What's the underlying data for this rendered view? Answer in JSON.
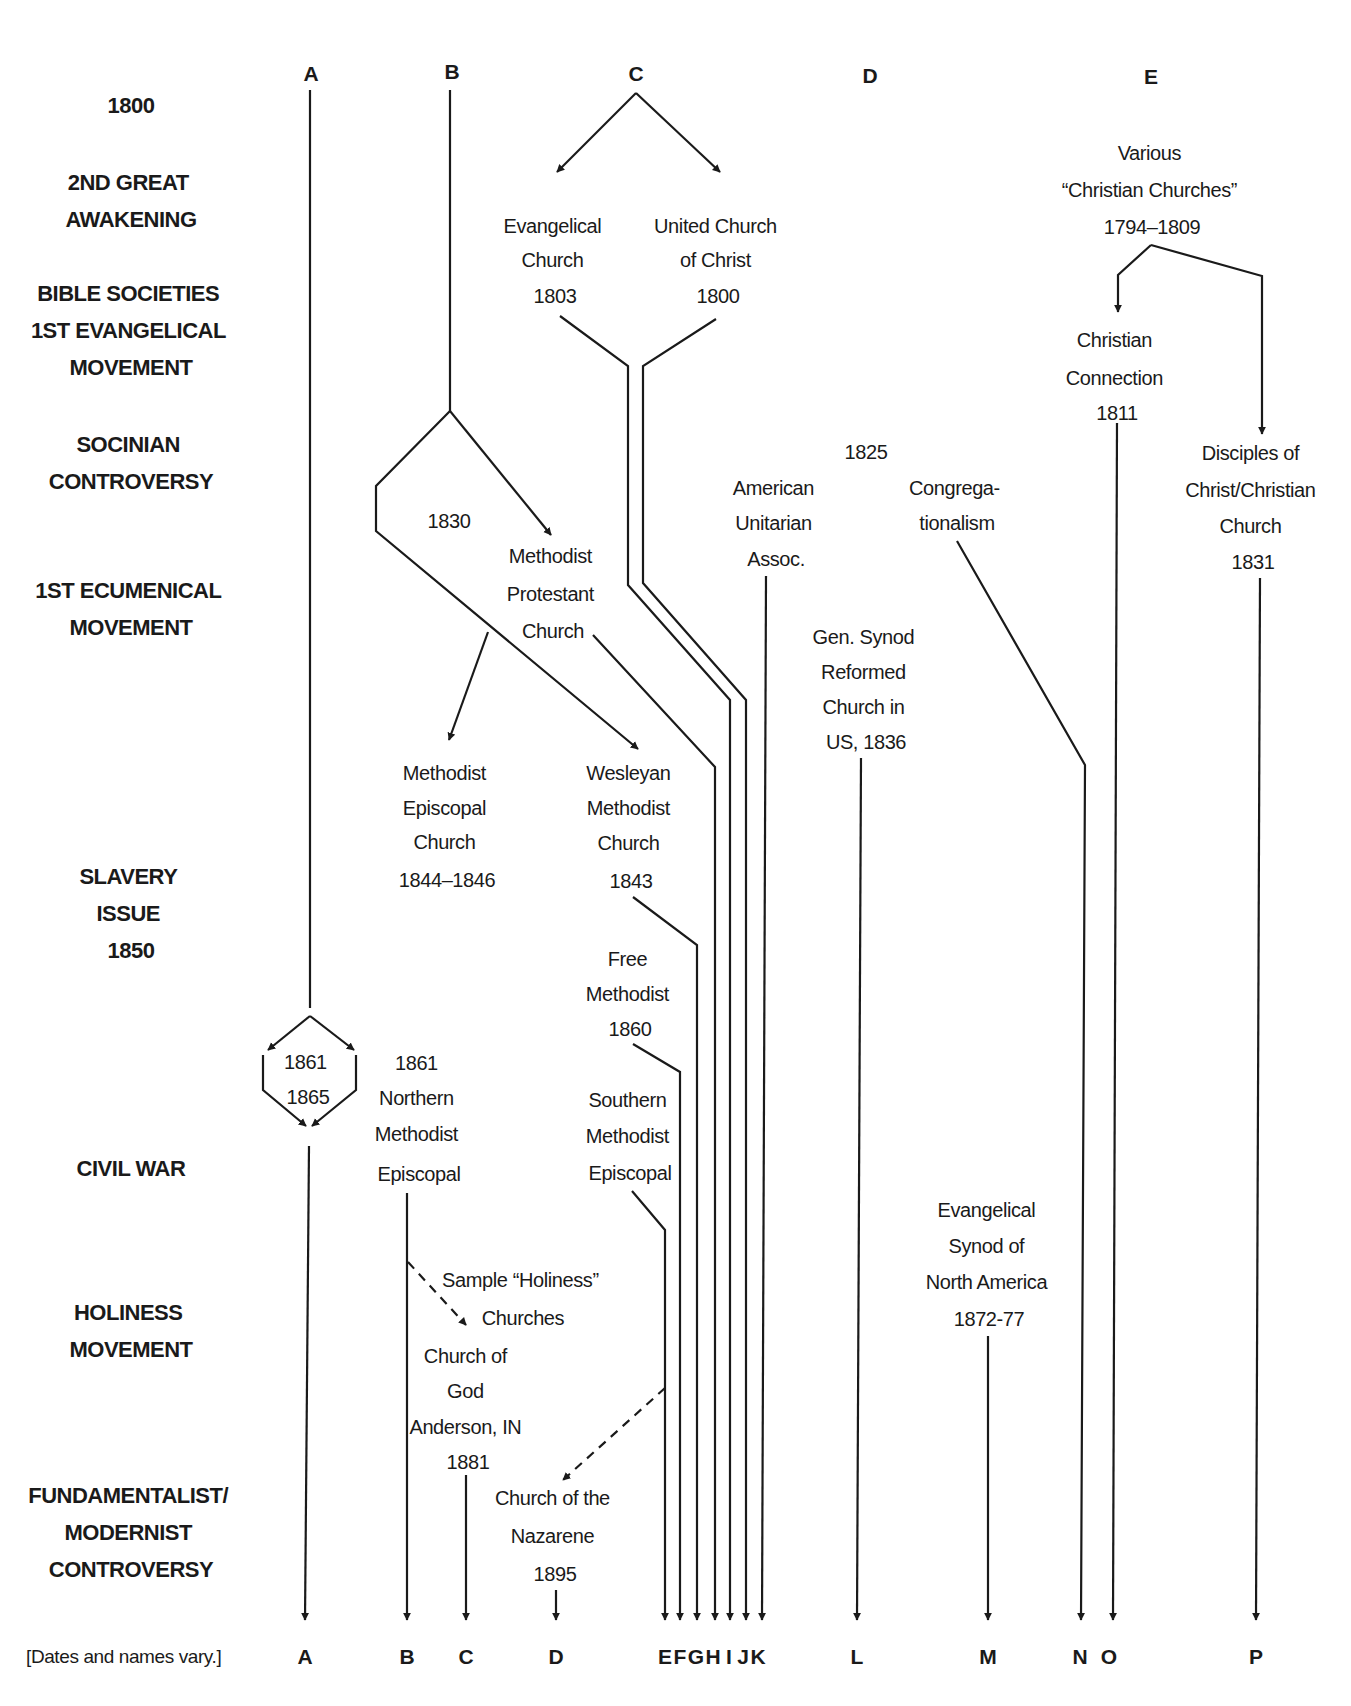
{
  "top_columns": [
    {
      "id": "A",
      "x": 288
    },
    {
      "id": "B",
      "x": 418
    },
    {
      "id": "C",
      "x": 590
    },
    {
      "id": "D",
      "x": 803
    },
    {
      "id": "E",
      "x": 1152
    }
  ],
  "eras": [
    {
      "lines": [
        "1800"
      ],
      "y": 105
    },
    {
      "lines": [
        "2ND GREAT",
        "AWAKENING"
      ],
      "y": 180
    },
    {
      "lines": [
        "BIBLE SOCIETIES",
        "1ST EVANGELICAL",
        "MOVEMENT"
      ],
      "y": 292
    },
    {
      "lines": [
        "SOCINIAN",
        "CONTROVERSY"
      ],
      "y": 440
    },
    {
      "lines": [
        "1ST ECUMENICAL",
        "MOVEMENT"
      ],
      "y": 590
    },
    {
      "lines": [
        "SLAVERY",
        "ISSUE",
        "1850"
      ],
      "y": 874
    },
    {
      "lines": [
        "CIVIL WAR"
      ],
      "y": 1168
    },
    {
      "lines": [
        "HOLINESS",
        "MOVEMENT"
      ],
      "y": 1312
    },
    {
      "lines": [
        "FUNDAMENTALIST/",
        "MODERNIST",
        "CONTROVERSY"
      ],
      "y": 1493
    }
  ],
  "nodes": [
    {
      "id": "evangelical-church",
      "lines": [
        "Evangelical",
        "Church",
        "1803"
      ],
      "x": 555,
      "y": 225
    },
    {
      "id": "united-church-of-christ",
      "lines": [
        "United Church",
        "of Christ",
        "1800"
      ],
      "x": 718,
      "y": 225
    },
    {
      "id": "various-christian-churches",
      "lines": [
        "Various",
        "“Christian Churches”",
        "1794–1809"
      ],
      "x": 1152,
      "y": 152
    },
    {
      "id": "christian-connection",
      "lines": [
        "Christian",
        "Connection",
        "1811"
      ],
      "x": 1117,
      "y": 339
    },
    {
      "id": "disciples-of-christ",
      "lines": [
        "Disciples of",
        "Christ/Christian",
        "Church",
        "1831"
      ],
      "x": 1253,
      "y": 452
    },
    {
      "id": "year-1825",
      "lines": [
        "1825"
      ],
      "x": 866,
      "y": 451
    },
    {
      "id": "american-unitarian-assoc",
      "lines": [
        "American",
        "Unitarian",
        "Assoc."
      ],
      "x": 776,
      "y": 487
    },
    {
      "id": "congregationalism",
      "lines": [
        "Congrega-",
        "tionalism"
      ],
      "x": 957,
      "y": 487
    },
    {
      "id": "year-1830",
      "lines": [
        "1830"
      ],
      "x": 449,
      "y": 520
    },
    {
      "id": "methodist-protestant-church",
      "lines": [
        "Methodist",
        "Protestant",
        "Church"
      ],
      "x": 553,
      "y": 555
    },
    {
      "id": "gen-synod-reformed",
      "lines": [
        "Gen. Synod",
        "Reformed",
        "Church in",
        "US, 1836"
      ],
      "x": 866,
      "y": 636
    },
    {
      "id": "methodist-episcopal-church",
      "lines": [
        "Methodist",
        "Episcopal",
        "Church",
        "1844–1846"
      ],
      "x": 447,
      "y": 772
    },
    {
      "id": "wesleyan-methodist-church",
      "lines": [
        "Wesleyan",
        "Methodist",
        "Church",
        "1843"
      ],
      "x": 631,
      "y": 772
    },
    {
      "id": "free-methodist",
      "lines": [
        "Free",
        "Methodist",
        "1860"
      ],
      "x": 630,
      "y": 958
    },
    {
      "id": "civil-war-years",
      "lines": [
        "1861",
        "1865"
      ],
      "x": 308,
      "y": 1061
    },
    {
      "id": "northern-methodist-episcopal",
      "lines": [
        "1861",
        "Northern",
        "Methodist",
        "Episcopal"
      ],
      "x": 419,
      "y": 1062
    },
    {
      "id": "southern-methodist-episcopal",
      "lines": [
        "Southern",
        "Methodist",
        "Episcopal"
      ],
      "x": 630,
      "y": 1099
    },
    {
      "id": "evangelical-synod-na",
      "lines": [
        "Evangelical",
        "Synod of",
        "North America",
        "1872-77"
      ],
      "x": 989,
      "y": 1209
    },
    {
      "id": "sample-holiness-churches",
      "lines": [
        "Sample “Holiness”",
        "Churches"
      ],
      "x": 523,
      "y": 1279
    },
    {
      "id": "church-of-god-anderson",
      "lines": [
        "Church of",
        "God",
        "Anderson, IN",
        "1881"
      ],
      "x": 468,
      "y": 1355
    },
    {
      "id": "church-of-the-nazarene",
      "lines": [
        "Church of the",
        "Nazarene",
        "1895"
      ],
      "x": 555,
      "y": 1497
    }
  ],
  "bottom_columns": [
    {
      "id": "A",
      "x": 305
    },
    {
      "id": "B",
      "x": 407
    },
    {
      "id": "C",
      "x": 466
    },
    {
      "id": "D",
      "x": 556
    },
    {
      "id": "E",
      "x": 665
    },
    {
      "id": "F",
      "x": 678
    },
    {
      "id": "G",
      "x": 692
    },
    {
      "id": "H",
      "x": 709
    },
    {
      "id": "I",
      "x": 726
    },
    {
      "id": "J",
      "x": 743
    },
    {
      "id": "K",
      "x": 757
    },
    {
      "id": "L",
      "x": 857
    },
    {
      "id": "M",
      "x": 988
    },
    {
      "id": "N",
      "x": 1080
    },
    {
      "id": "O",
      "x": 1109
    },
    {
      "id": "P",
      "x": 1256
    }
  ],
  "footnote": "[Dates and names vary.]",
  "colors": {
    "ink": "#1a1a1a",
    "background": "#ffffff"
  }
}
